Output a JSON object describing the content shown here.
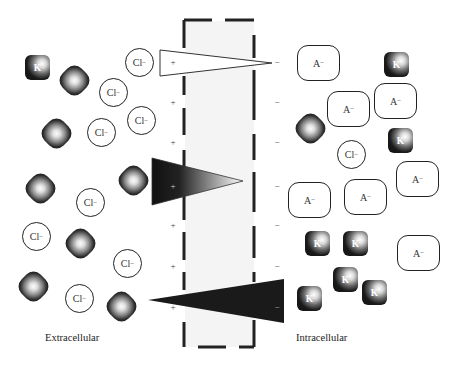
{
  "labels": {
    "extracellular": "Extracellular",
    "intracellular": "Intracellular"
  },
  "ion_symbols": {
    "chloride": "Cl",
    "potassium": "K",
    "sodium": "Na",
    "anion": "A",
    "minus": "−",
    "plus": "+"
  },
  "membrane": {
    "outer_side_charge": "+",
    "inner_side_charge": "−"
  },
  "gradients": [
    {
      "ion": "Cl−",
      "shape": "white triangle",
      "wide_side": "extracellular"
    },
    {
      "ion": "Na+",
      "shape": "black-to-white gradient triangle",
      "wide_side": "extracellular"
    },
    {
      "ion": "K+",
      "shape": "black triangle",
      "wide_side": "intracellular"
    }
  ],
  "colors": {
    "ion_dark": "#111111",
    "outline": "#222222",
    "membrane_fill": "#f4f4f4"
  }
}
